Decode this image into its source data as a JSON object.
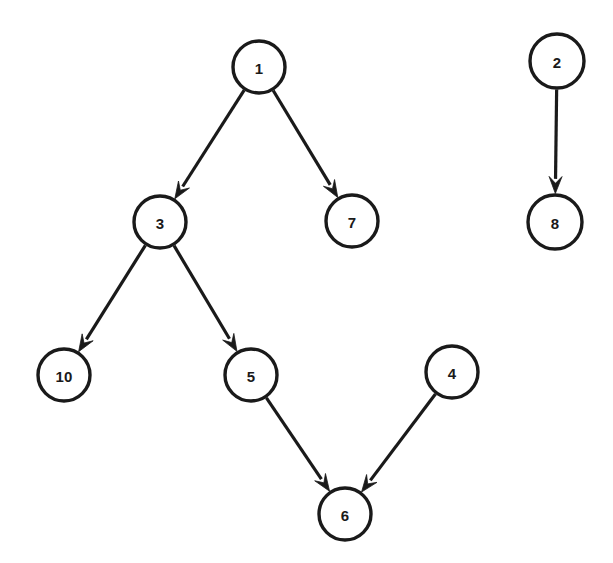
{
  "diagram": {
    "type": "directed-graph",
    "width": 613,
    "height": 563,
    "background_color": "#ffffff",
    "stroke_color": "#1a1a1a",
    "node_fill_color": "#ffffff",
    "node_radius": 26,
    "node_stroke_width": 3.4,
    "edge_stroke_width": 3.2,
    "arrowhead_length": 17,
    "arrowhead_width": 13,
    "nodes": [
      {
        "id": "n1",
        "label": "1",
        "cx": 259,
        "cy": 67,
        "r": 26
      },
      {
        "id": "n3",
        "label": "3",
        "cx": 160,
        "cy": 222,
        "r": 26
      },
      {
        "id": "n7",
        "label": "7",
        "cx": 352,
        "cy": 221,
        "r": 26
      },
      {
        "id": "n10",
        "label": "10",
        "cx": 64,
        "cy": 375,
        "r": 26
      },
      {
        "id": "n5",
        "label": "5",
        "cx": 251,
        "cy": 375,
        "r": 26
      },
      {
        "id": "n4",
        "label": "4",
        "cx": 452,
        "cy": 372,
        "r": 26
      },
      {
        "id": "n6",
        "label": "6",
        "cx": 345,
        "cy": 514,
        "r": 26
      },
      {
        "id": "n2",
        "label": "2",
        "cx": 557,
        "cy": 61,
        "r": 27
      },
      {
        "id": "n8",
        "label": "8",
        "cx": 555,
        "cy": 222,
        "r": 27
      }
    ],
    "edges": [
      {
        "id": "e1",
        "from": "n1",
        "to": "n3",
        "from_label": "1",
        "to_label": "3",
        "directed": true
      },
      {
        "id": "e2",
        "from": "n1",
        "to": "n7",
        "from_label": "1",
        "to_label": "7",
        "directed": true
      },
      {
        "id": "e3",
        "from": "n3",
        "to": "n10",
        "from_label": "3",
        "to_label": "10",
        "directed": true
      },
      {
        "id": "e4",
        "from": "n3",
        "to": "n5",
        "from_label": "3",
        "to_label": "5",
        "directed": true
      },
      {
        "id": "e5",
        "from": "n5",
        "to": "n6",
        "from_label": "5",
        "to_label": "6",
        "directed": true
      },
      {
        "id": "e6",
        "from": "n4",
        "to": "n6",
        "from_label": "4",
        "to_label": "6",
        "directed": true
      },
      {
        "id": "e7",
        "from": "n2",
        "to": "n8",
        "from_label": "2",
        "to_label": "8",
        "directed": true
      }
    ]
  }
}
